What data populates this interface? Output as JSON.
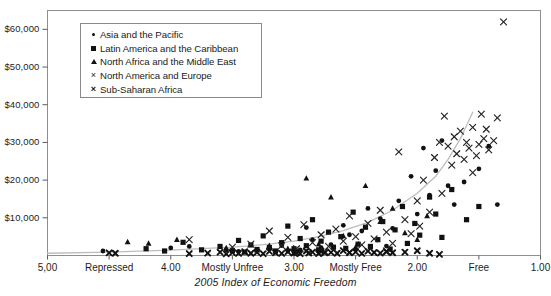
{
  "chart_data": {
    "type": "scatter",
    "title": "",
    "xlabel": "2005 Index of Economic Freedom",
    "ylabel": "",
    "xlim": [
      5.0,
      1.0
    ],
    "ylim": [
      0,
      65000
    ],
    "x_axis_inverted": true,
    "grid": false,
    "legend_position": "top-left-inside",
    "y_ticks": [
      "$10,000",
      "$20,000",
      "$30,000",
      "$40,000",
      "$50,000",
      "$60,000"
    ],
    "y_tick_values": [
      10000,
      20000,
      30000,
      40000,
      50000,
      60000
    ],
    "x_ticks": [
      "5,00",
      "Repressed",
      "4.00",
      "Mostly Unfree",
      "3.00",
      "Mostly Free",
      "2.00",
      "Free",
      "1.00"
    ],
    "x_tick_values": [
      5.0,
      4.5,
      4.0,
      3.5,
      3.0,
      2.5,
      2.0,
      1.5,
      1.0
    ],
    "trendline": {
      "type": "exponential",
      "points": [
        [
          5.0,
          600
        ],
        [
          4.5,
          900
        ],
        [
          4.0,
          1400
        ],
        [
          3.5,
          2200
        ],
        [
          3.2,
          3000
        ],
        [
          3.0,
          3800
        ],
        [
          2.8,
          5000
        ],
        [
          2.6,
          6600
        ],
        [
          2.4,
          8800
        ],
        [
          2.2,
          12000
        ],
        [
          2.0,
          16500
        ],
        [
          1.85,
          21000
        ],
        [
          1.75,
          25500
        ],
        [
          1.65,
          31000
        ],
        [
          1.6,
          34500
        ],
        [
          1.55,
          38000
        ]
      ],
      "color": "#bdbdbd"
    },
    "series": [
      {
        "name": "Asia and the Pacific",
        "marker": "circle",
        "color": "#111111",
        "points": [
          [
            4.55,
            1200
          ],
          [
            4.0,
            2000
          ],
          [
            3.85,
            2400
          ],
          [
            3.55,
            1500
          ],
          [
            3.45,
            1100
          ],
          [
            3.3,
            1400
          ],
          [
            3.2,
            1900
          ],
          [
            3.15,
            900
          ],
          [
            3.1,
            2600
          ],
          [
            3.05,
            1200
          ],
          [
            3.0,
            800
          ],
          [
            2.95,
            1500
          ],
          [
            2.9,
            7400
          ],
          [
            2.85,
            4200
          ],
          [
            2.8,
            1100
          ],
          [
            2.78,
            2100
          ],
          [
            2.7,
            2900
          ],
          [
            2.6,
            8000
          ],
          [
            2.55,
            5500
          ],
          [
            2.5,
            1600
          ],
          [
            2.45,
            6500
          ],
          [
            2.4,
            12500
          ],
          [
            2.3,
            9800
          ],
          [
            2.25,
            2500
          ],
          [
            2.2,
            7200
          ],
          [
            2.15,
            14500
          ],
          [
            2.05,
            21000
          ],
          [
            2.0,
            11000
          ],
          [
            1.95,
            28500
          ],
          [
            1.9,
            16000
          ],
          [
            1.85,
            22500
          ],
          [
            1.8,
            30500
          ],
          [
            1.75,
            18500
          ],
          [
            1.7,
            13500
          ],
          [
            1.62,
            19500
          ],
          [
            1.5,
            23000
          ],
          [
            1.42,
            29000
          ],
          [
            1.35,
            13500
          ]
        ]
      },
      {
        "name": "Latin America and the Caribbean",
        "marker": "square",
        "color": "#111111",
        "points": [
          [
            4.2,
            1800
          ],
          [
            4.05,
            1200
          ],
          [
            3.9,
            3500
          ],
          [
            3.75,
            1500
          ],
          [
            3.6,
            2400
          ],
          [
            3.5,
            1300
          ],
          [
            3.45,
            4000
          ],
          [
            3.4,
            900
          ],
          [
            3.35,
            2800
          ],
          [
            3.3,
            1600
          ],
          [
            3.25,
            5200
          ],
          [
            3.2,
            2100
          ],
          [
            3.15,
            1200
          ],
          [
            3.1,
            3400
          ],
          [
            3.05,
            7800
          ],
          [
            3.0,
            1800
          ],
          [
            2.95,
            4500
          ],
          [
            2.9,
            2600
          ],
          [
            2.85,
            9500
          ],
          [
            2.8,
            1500
          ],
          [
            2.78,
            3800
          ],
          [
            2.72,
            6200
          ],
          [
            2.68,
            2200
          ],
          [
            2.62,
            5000
          ],
          [
            2.58,
            1900
          ],
          [
            2.52,
            11500
          ],
          [
            2.48,
            3000
          ],
          [
            2.42,
            7500
          ],
          [
            2.38,
            2400
          ],
          [
            2.32,
            4200
          ],
          [
            2.28,
            9000
          ],
          [
            2.22,
            1700
          ],
          [
            2.18,
            6800
          ],
          [
            2.12,
            13000
          ],
          [
            2.08,
            3200
          ],
          [
            2.02,
            8500
          ],
          [
            1.98,
            5400
          ],
          [
            1.9,
            15500
          ],
          [
            1.85,
            11000
          ],
          [
            1.8,
            4800
          ],
          [
            1.72,
            17500
          ],
          [
            1.6,
            9500
          ],
          [
            1.5,
            13000
          ]
        ]
      },
      {
        "name": "North Africa and the Middle East",
        "marker": "triangle",
        "color": "#111111",
        "points": [
          [
            4.35,
            3600
          ],
          [
            4.18,
            3200
          ],
          [
            3.95,
            4200
          ],
          [
            3.55,
            2000
          ],
          [
            3.3,
            1400
          ],
          [
            3.2,
            2600
          ],
          [
            3.05,
            1800
          ],
          [
            2.9,
            20500
          ],
          [
            2.8,
            3000
          ],
          [
            2.7,
            15500
          ],
          [
            2.6,
            5200
          ],
          [
            2.5,
            2200
          ],
          [
            2.42,
            18500
          ],
          [
            2.3,
            9000
          ],
          [
            2.2,
            12500
          ],
          [
            2.1,
            6000
          ],
          [
            2.0,
            4200
          ],
          [
            1.92,
            10500
          ]
        ]
      },
      {
        "name": "North America and Europe",
        "marker": "x-thin",
        "color": "#222222",
        "points": [
          [
            3.85,
            4200
          ],
          [
            3.5,
            2200
          ],
          [
            3.35,
            3000
          ],
          [
            3.2,
            6500
          ],
          [
            3.1,
            2600
          ],
          [
            3.05,
            4800
          ],
          [
            2.98,
            1800
          ],
          [
            2.92,
            8200
          ],
          [
            2.85,
            3400
          ],
          [
            2.78,
            5500
          ],
          [
            2.72,
            2400
          ],
          [
            2.66,
            7000
          ],
          [
            2.6,
            3800
          ],
          [
            2.55,
            10500
          ],
          [
            2.5,
            5000
          ],
          [
            2.45,
            2800
          ],
          [
            2.4,
            8500
          ],
          [
            2.35,
            4400
          ],
          [
            2.3,
            12000
          ],
          [
            2.25,
            6200
          ],
          [
            2.2,
            3200
          ],
          [
            2.15,
            27500
          ],
          [
            2.1,
            9500
          ],
          [
            2.05,
            5800
          ],
          [
            2.0,
            14500
          ],
          [
            1.98,
            7800
          ],
          [
            1.95,
            20000
          ],
          [
            1.9,
            11500
          ],
          [
            1.86,
            26000
          ],
          [
            1.82,
            30000
          ],
          [
            1.8,
            16500
          ],
          [
            1.78,
            37000
          ],
          [
            1.75,
            29000
          ],
          [
            1.72,
            24000
          ],
          [
            1.7,
            31500
          ],
          [
            1.68,
            27000
          ],
          [
            1.65,
            33000
          ],
          [
            1.62,
            25500
          ],
          [
            1.6,
            30000
          ],
          [
            1.58,
            28500
          ],
          [
            1.55,
            34000
          ],
          [
            1.52,
            26500
          ],
          [
            1.5,
            29500
          ],
          [
            1.48,
            37500
          ],
          [
            1.46,
            31000
          ],
          [
            1.44,
            33500
          ],
          [
            1.42,
            28000
          ],
          [
            1.38,
            30500
          ],
          [
            1.35,
            36500
          ],
          [
            1.3,
            62000
          ],
          [
            1.55,
            22000
          ],
          [
            2.25,
            1200
          ],
          [
            2.55,
            900
          ],
          [
            2.75,
            1100
          ],
          [
            3.0,
            800
          ]
        ]
      },
      {
        "name": "Sub-Saharan Africa",
        "marker": "x-bold",
        "color": "#111111",
        "points": [
          [
            4.5,
            700
          ],
          [
            4.45,
            600
          ],
          [
            3.85,
            500
          ],
          [
            3.7,
            650
          ],
          [
            3.6,
            900
          ],
          [
            3.55,
            450
          ],
          [
            3.5,
            750
          ],
          [
            3.45,
            550
          ],
          [
            3.4,
            1000
          ],
          [
            3.35,
            600
          ],
          [
            3.3,
            820
          ],
          [
            3.25,
            480
          ],
          [
            3.2,
            1100
          ],
          [
            3.15,
            700
          ],
          [
            3.1,
            550
          ],
          [
            3.05,
            950
          ],
          [
            3.0,
            620
          ],
          [
            2.98,
            780
          ],
          [
            2.95,
            500
          ],
          [
            2.9,
            1200
          ],
          [
            2.88,
            660
          ],
          [
            2.85,
            900
          ],
          [
            2.8,
            520
          ],
          [
            2.78,
            1050
          ],
          [
            2.75,
            700
          ],
          [
            2.7,
            850
          ],
          [
            2.65,
            600
          ],
          [
            2.6,
            1300
          ],
          [
            2.55,
            740
          ],
          [
            2.5,
            980
          ],
          [
            2.45,
            560
          ],
          [
            2.4,
            1150
          ],
          [
            2.35,
            800
          ],
          [
            2.3,
            640
          ],
          [
            2.25,
            1000
          ],
          [
            2.2,
            720
          ],
          [
            2.1,
            880
          ],
          [
            2.0,
            1250
          ],
          [
            1.9,
            600
          ],
          [
            1.82,
            300
          ]
        ]
      }
    ]
  },
  "legend": {
    "items": [
      {
        "label": "Asia and the Pacific",
        "marker": "dot"
      },
      {
        "label": "Latin America and the Caribbean",
        "marker": "square"
      },
      {
        "label": "North Africa and the Middle East",
        "marker": "triangle"
      },
      {
        "label": "North America and Europe",
        "marker": "x-thin"
      },
      {
        "label": "Sub-Saharan Africa",
        "marker": "x-bold"
      }
    ]
  },
  "axis": {
    "y_labels": [
      "$60,000",
      "$50,000",
      "$40,000",
      "$30,000",
      "$20,000",
      "$10,000"
    ],
    "x_labels": [
      "5,00",
      "Repressed",
      "4.00",
      "Mostly Unfree",
      "3.00",
      "Mostly Free",
      "2.00",
      "Free",
      "1.00"
    ],
    "x_title": "2005 Index of Economic Freedom"
  }
}
